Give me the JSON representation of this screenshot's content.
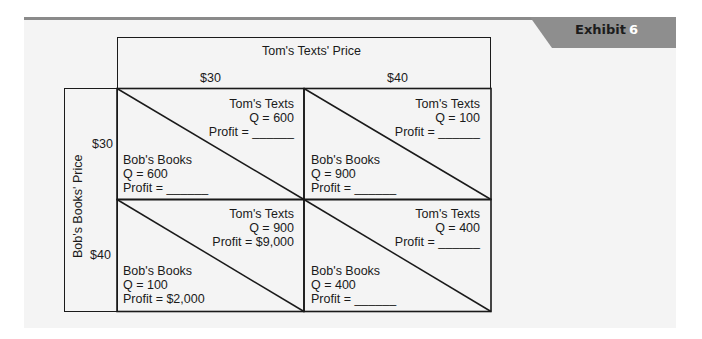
{
  "exhibit": {
    "label": "Exhibit",
    "number": "6"
  },
  "matrix": {
    "column_header": "Tom's Texts' Price",
    "row_header": "Bob's Books' Price",
    "columns": [
      "$30",
      "$40"
    ],
    "rows": [
      "$30",
      "$40"
    ],
    "cells": [
      {
        "row": "$30",
        "col": "$30",
        "tom": {
          "name": "Tom's Texts",
          "q": "Q = 600",
          "profit": "Profit = ______"
        },
        "bob": {
          "name": "Bob's Books",
          "q": "Q = 600",
          "profit": "Profit = ______"
        }
      },
      {
        "row": "$30",
        "col": "$40",
        "tom": {
          "name": "Tom's Texts",
          "q": "Q = 100",
          "profit": "Profit = ______"
        },
        "bob": {
          "name": "Bob's Books",
          "q": "Q = 900",
          "profit": "Profit = ______"
        }
      },
      {
        "row": "$40",
        "col": "$30",
        "tom": {
          "name": "Tom's Texts",
          "q": "Q = 900",
          "profit": "Profit = $9,000"
        },
        "bob": {
          "name": "Bob's Books",
          "q": "Q = 100",
          "profit": "Profit = $2,000"
        }
      },
      {
        "row": "$40",
        "col": "$40",
        "tom": {
          "name": "Tom's Texts",
          "q": "Q = 400",
          "profit": "Profit = ______"
        },
        "bob": {
          "name": "Bob's Books",
          "q": "Q = 400",
          "profit": "Profit = ______"
        }
      }
    ]
  }
}
